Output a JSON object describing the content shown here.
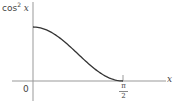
{
  "diagram": {
    "y_axis_label": {
      "fn": "cos",
      "exp": "2",
      "var": "x"
    },
    "x_axis_label": "x",
    "origin_label": "0",
    "tick_label": {
      "numerator": "π",
      "denominator": "2"
    },
    "colors": {
      "axis": "#999999",
      "curve": "#333333",
      "text": "#444444"
    }
  },
  "chart_data": {
    "type": "line",
    "title": "",
    "xlabel": "x",
    "ylabel": "cos² x",
    "x": [
      0,
      0.1963,
      0.3927,
      0.589,
      0.7854,
      0.9817,
      1.1781,
      1.3744,
      1.5708
    ],
    "values": [
      1.0,
      0.962,
      0.854,
      0.691,
      0.5,
      0.309,
      0.146,
      0.038,
      0.0
    ],
    "x_ticks": [
      {
        "value": 0,
        "label": "0"
      },
      {
        "value": 1.5708,
        "label": "π/2"
      }
    ],
    "xlim": [
      -0.3,
      2.0
    ],
    "ylim": [
      -0.35,
      1.45
    ],
    "grid": false,
    "legend": null
  }
}
